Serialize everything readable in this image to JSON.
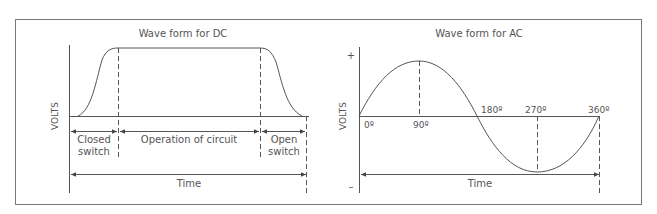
{
  "dc": {
    "title": "Wave form for DC",
    "y_axis_label": "VOLTS",
    "segments": [
      {
        "line1": "Closed",
        "line2": "switch"
      },
      {
        "line1": "Operation of circuit"
      },
      {
        "line1": "Open",
        "line2": "switch"
      }
    ],
    "time_label": "Time"
  },
  "ac": {
    "title": "Wave form for AC",
    "y_axis_label": "VOLTS",
    "plus_sign": "+",
    "minus_sign": "–",
    "angles": [
      "0º",
      "90º",
      "180º",
      "270º",
      "360º"
    ],
    "time_label": "Time"
  },
  "colors": {
    "line": "#555555",
    "frame": "#666666",
    "text": "#555555"
  }
}
